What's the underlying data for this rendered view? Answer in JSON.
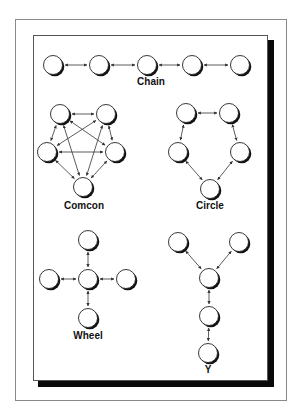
{
  "figure": {
    "colors": {
      "background": "#ffffff",
      "outer_frame": "#8a8a8a",
      "panel_border": "#555555",
      "panel_shadow": "#0a0a0a",
      "node_fill": "#ffffff",
      "node_outline": "#222222",
      "node_shadow": "#111111",
      "edge": "#333333"
    },
    "node_radius": 9.5
  },
  "networks": [
    {
      "id": "chain",
      "label": "Chain",
      "label_pos": {
        "x": 151,
        "y": 77
      },
      "nodes": [
        {
          "id": "c1",
          "x": 53,
          "y": 65
        },
        {
          "id": "c2",
          "x": 99,
          "y": 65
        },
        {
          "id": "c3",
          "x": 147,
          "y": 65
        },
        {
          "id": "c4",
          "x": 192,
          "y": 65
        },
        {
          "id": "c5",
          "x": 240,
          "y": 65
        }
      ],
      "edges": [
        [
          "c1",
          "c2"
        ],
        [
          "c2",
          "c3"
        ],
        [
          "c3",
          "c4"
        ],
        [
          "c4",
          "c5"
        ]
      ]
    },
    {
      "id": "comcon",
      "label": "Comcon",
      "label_pos": {
        "x": 84,
        "y": 201
      },
      "nodes": [
        {
          "id": "m1",
          "x": 60,
          "y": 114
        },
        {
          "id": "m2",
          "x": 106,
          "y": 114
        },
        {
          "id": "m3",
          "x": 47,
          "y": 152
        },
        {
          "id": "m4",
          "x": 115,
          "y": 152
        },
        {
          "id": "m5",
          "x": 83,
          "y": 187
        }
      ],
      "edges": [
        [
          "m1",
          "m2"
        ],
        [
          "m1",
          "m3"
        ],
        [
          "m1",
          "m4"
        ],
        [
          "m1",
          "m5"
        ],
        [
          "m2",
          "m3"
        ],
        [
          "m2",
          "m4"
        ],
        [
          "m2",
          "m5"
        ],
        [
          "m3",
          "m4"
        ],
        [
          "m3",
          "m5"
        ],
        [
          "m4",
          "m5"
        ]
      ]
    },
    {
      "id": "circle",
      "label": "Circle",
      "label_pos": {
        "x": 210,
        "y": 201
      },
      "nodes": [
        {
          "id": "r1",
          "x": 186,
          "y": 113
        },
        {
          "id": "r2",
          "x": 229,
          "y": 113
        },
        {
          "id": "r3",
          "x": 178,
          "y": 152
        },
        {
          "id": "r4",
          "x": 240,
          "y": 152
        },
        {
          "id": "r5",
          "x": 210,
          "y": 189
        }
      ],
      "edges": [
        [
          "r1",
          "r2"
        ],
        [
          "r2",
          "r4"
        ],
        [
          "r4",
          "r5"
        ],
        [
          "r5",
          "r3"
        ],
        [
          "r3",
          "r1"
        ]
      ]
    },
    {
      "id": "wheel",
      "label": "Wheel",
      "label_pos": {
        "x": 88,
        "y": 331
      },
      "nodes": [
        {
          "id": "w1",
          "x": 88,
          "y": 240
        },
        {
          "id": "w2",
          "x": 49,
          "y": 279
        },
        {
          "id": "w3",
          "x": 88,
          "y": 279
        },
        {
          "id": "w4",
          "x": 126,
          "y": 279
        },
        {
          "id": "w5",
          "x": 88,
          "y": 318
        }
      ],
      "edges": [
        [
          "w3",
          "w1"
        ],
        [
          "w3",
          "w2"
        ],
        [
          "w3",
          "w4"
        ],
        [
          "w3",
          "w5"
        ]
      ]
    },
    {
      "id": "y",
      "label": "Y",
      "label_pos": {
        "x": 208,
        "y": 365
      },
      "nodes": [
        {
          "id": "y1",
          "x": 178,
          "y": 242
        },
        {
          "id": "y2",
          "x": 239,
          "y": 242
        },
        {
          "id": "y3",
          "x": 209,
          "y": 278
        },
        {
          "id": "y4",
          "x": 209,
          "y": 316
        },
        {
          "id": "y5",
          "x": 208,
          "y": 353
        }
      ],
      "edges": [
        [
          "y1",
          "y3"
        ],
        [
          "y2",
          "y3"
        ],
        [
          "y3",
          "y4"
        ],
        [
          "y4",
          "y5"
        ]
      ]
    }
  ]
}
